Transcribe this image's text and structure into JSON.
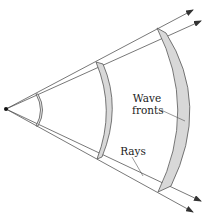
{
  "diagram": {
    "labels": {
      "wave_line1": "Wave",
      "wave_line2": "fronts",
      "rays": "Rays"
    },
    "colors": {
      "stroke": "#555555",
      "front_fill": "#d8d8d8",
      "source": "#111111",
      "background": "#ffffff"
    },
    "elements": {
      "source": "point-source",
      "wave_fronts": [
        "small-front",
        "middle-front",
        "large-front"
      ],
      "rays": [
        "upper-ray-outer",
        "upper-ray-inner",
        "lower-ray-inner",
        "lower-ray-outer"
      ]
    }
  }
}
